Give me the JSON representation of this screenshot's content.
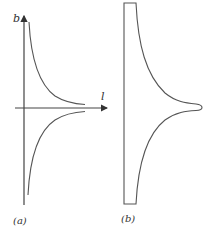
{
  "figure": {
    "panels": [
      {
        "id": "a",
        "caption": "(a)",
        "y_axis_label": "b",
        "x_axis_label": "l",
        "description": "Plot of b versus l: two hyperbola-like branches approaching the l-axis, one above and one mirrored below"
      },
      {
        "id": "b",
        "caption": "(b)",
        "description": "Shape formed by the branches: vertical straight left edge, flat top and bottom, right edge follows the curves converging to a rounded tip at the axis"
      }
    ],
    "colors": {
      "line": "#555555",
      "axis": "#444444",
      "text": "#333333",
      "background": "#ffffff"
    }
  }
}
